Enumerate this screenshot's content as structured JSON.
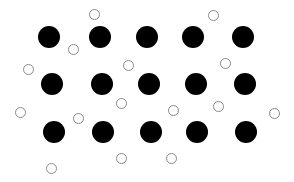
{
  "diagram": {
    "type": "particle-lattice",
    "canvas": {
      "width": 294,
      "height": 182,
      "background": "#ffffff"
    },
    "large_particles": {
      "color": "#000000",
      "radius": 11,
      "points": [
        {
          "x": 49,
          "y": 37
        },
        {
          "x": 100,
          "y": 37
        },
        {
          "x": 147,
          "y": 37
        },
        {
          "x": 193,
          "y": 37
        },
        {
          "x": 243,
          "y": 37
        },
        {
          "x": 52,
          "y": 84
        },
        {
          "x": 102,
          "y": 84
        },
        {
          "x": 149,
          "y": 84
        },
        {
          "x": 196,
          "y": 84
        },
        {
          "x": 245,
          "y": 84
        },
        {
          "x": 54,
          "y": 132
        },
        {
          "x": 103,
          "y": 132
        },
        {
          "x": 151,
          "y": 132
        },
        {
          "x": 197,
          "y": 132
        },
        {
          "x": 246,
          "y": 132
        }
      ]
    },
    "small_particles": {
      "fill": "#ffffff",
      "stroke": "#8a8a8a",
      "radius": 5,
      "points": [
        {
          "x": 94,
          "y": 14
        },
        {
          "x": 213,
          "y": 15
        },
        {
          "x": 73,
          "y": 49
        },
        {
          "x": 28,
          "y": 69
        },
        {
          "x": 128,
          "y": 65
        },
        {
          "x": 225,
          "y": 63
        },
        {
          "x": 121,
          "y": 103
        },
        {
          "x": 173,
          "y": 110
        },
        {
          "x": 218,
          "y": 106
        },
        {
          "x": 20,
          "y": 112
        },
        {
          "x": 78,
          "y": 118
        },
        {
          "x": 274,
          "y": 113
        },
        {
          "x": 121,
          "y": 158
        },
        {
          "x": 171,
          "y": 158
        },
        {
          "x": 51,
          "y": 168
        }
      ]
    }
  }
}
